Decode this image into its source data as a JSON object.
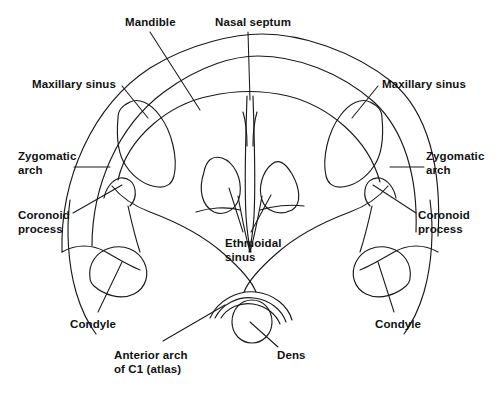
{
  "figure": {
    "type": "anatomical-line-diagram",
    "view": "axial cross-section of skull base",
    "background_color": "#ffffff",
    "line_color": "#1a1a1a",
    "text_color": "#111111",
    "width": 498,
    "height": 394
  },
  "labels": [
    {
      "id": "mandible",
      "text": "Mandible",
      "x": 125,
      "y": 16,
      "align": "left"
    },
    {
      "id": "nasal-septum",
      "text": "Nasal septum",
      "x": 215,
      "y": 16,
      "align": "left"
    },
    {
      "id": "maxillary-sinus-left",
      "text": "Maxillary sinus",
      "x": 32,
      "y": 78,
      "align": "left"
    },
    {
      "id": "maxillary-sinus-right",
      "text": "Maxillary sinus",
      "x": 382,
      "y": 78,
      "align": "left"
    },
    {
      "id": "zygomatic-arch-left",
      "text": "Zygomatic\narch",
      "x": 18,
      "y": 150,
      "align": "left"
    },
    {
      "id": "zygomatic-arch-right",
      "text": "Zygomatic\narch",
      "x": 426,
      "y": 150,
      "align": "left"
    },
    {
      "id": "coronoid-process-left",
      "text": "Coronoid\nprocess",
      "x": 18,
      "y": 209,
      "align": "left"
    },
    {
      "id": "coronoid-process-right",
      "text": "Coronoid\nprocess",
      "x": 418,
      "y": 209,
      "align": "left"
    },
    {
      "id": "ethmoidal-sinus",
      "text": "Ethmoidal\nsinus",
      "x": 225,
      "y": 237,
      "align": "left"
    },
    {
      "id": "condyle-left",
      "text": "Condyle",
      "x": 70,
      "y": 318,
      "align": "left"
    },
    {
      "id": "condyle-right",
      "text": "Condyle",
      "x": 375,
      "y": 318,
      "align": "left"
    },
    {
      "id": "anterior-arch-c1",
      "text": "Anterior arch\nof C1 (atlas)",
      "x": 114,
      "y": 349,
      "align": "left"
    },
    {
      "id": "dens",
      "text": "Dens",
      "x": 277,
      "y": 349,
      "align": "left"
    }
  ],
  "leader_lines": [
    {
      "id": "leader-mandible",
      "d": "M 150 32 L 200 110"
    },
    {
      "id": "leader-nasal-septum",
      "d": "M 248 32 L 250 100"
    },
    {
      "id": "leader-maxillary-sinus-left",
      "d": "M 122 86 L 148 118"
    },
    {
      "id": "leader-maxillary-sinus-right",
      "d": "M 378 86 L 352 118"
    },
    {
      "id": "leader-zygomatic-arch-left",
      "d": "M 74 167 L 110 167"
    },
    {
      "id": "leader-zygomatic-arch-right",
      "d": "M 424 167 L 390 167"
    },
    {
      "id": "leader-coronoid-process-left",
      "d": "M 73 213 L 122 185"
    },
    {
      "id": "leader-coronoid-process-right",
      "d": "M 416 213 L 373 185"
    },
    {
      "id": "leader-ethmoidal-sinus-left",
      "d": "M 243 232 L 229 188"
    },
    {
      "id": "leader-ethmoidal-sinus-right",
      "d": "M 251 232 L 271 195"
    },
    {
      "id": "leader-condyle-left",
      "d": "M 98 312 L 122 262"
    },
    {
      "id": "leader-condyle-right",
      "d": "M 394 312 L 378 262"
    },
    {
      "id": "leader-anterior-arch-c1",
      "d": "M 163 341 L 225 305"
    },
    {
      "id": "leader-dens",
      "d": "M 278 347 L 250 322"
    }
  ],
  "outline_paths": [
    {
      "id": "cranium-outer",
      "d": "M 62 252 C 60 180 92 106 150 68 C 192 42 238 34 262 34 C 300 34 352 50 392 82 C 428 112 442 168 438 236"
    },
    {
      "id": "cranium-inner",
      "d": "M 92 246 C 92 186 118 126 164 92 C 202 64 236 56 258 56 C 296 56 340 72 374 102 C 404 130 418 176 416 232"
    },
    {
      "id": "maxilla-arch",
      "d": "M 118 180 C 128 136 170 104 210 96 C 236 90 262 90 288 96 C 328 106 368 138 380 182"
    },
    {
      "id": "left-sinus-pocket",
      "d": "M 118 118 C 116 140 119 156 126 166 C 134 178 146 186 158 187 C 166 188 172 184 174 176 C 178 158 172 132 160 116 C 150 102 138 98 130 102 C 122 106 118 110 118 118 Z"
    },
    {
      "id": "right-sinus-pocket",
      "d": "M 382 118 C 384 140 381 156 374 166 C 366 178 354 186 342 187 C 334 188 328 184 326 176 C 322 158 328 132 340 116 C 350 102 362 98 370 102 C 378 106 382 110 382 118 Z"
    },
    {
      "id": "left-ramus-outer",
      "d": "M 112 186 C 120 196 134 206 150 212 C 174 221 204 236 224 254 C 240 268 252 282 256 292"
    },
    {
      "id": "right-ramus-outer",
      "d": "M 388 186 C 380 196 366 206 350 212 C 326 221 296 236 276 254 C 260 268 248 282 244 292"
    },
    {
      "id": "left-coronoid",
      "d": "M 104 198 C 106 188 112 180 120 178 C 128 177 134 182 135 190 C 136 196 134 202 130 206"
    },
    {
      "id": "right-coronoid",
      "d": "M 396 198 C 394 188 388 180 380 178 C 372 177 366 182 365 190 C 364 196 366 202 370 206"
    },
    {
      "id": "left-condyle",
      "d": "M 90 278 C 88 264 96 252 110 248 C 124 244 138 250 144 262 C 150 274 146 288 134 294 C 120 301 103 294 94 286 C 91 283 90 280 90 278 Z"
    },
    {
      "id": "right-condyle",
      "d": "M 410 278 C 412 264 404 252 390 248 C 376 244 362 250 356 262 C 350 274 354 288 366 294 C 380 301 397 294 406 286 C 409 283 410 280 410 278 Z"
    },
    {
      "id": "left-lateral-wall",
      "d": "M 70 200 C 66 230 68 264 76 292 C 82 312 90 326 96 334"
    },
    {
      "id": "right-lateral-wall",
      "d": "M 430 200 C 434 230 432 264 424 292 C 418 312 410 326 404 334"
    },
    {
      "id": "left-inner-ramus",
      "d": "M 128 206 C 132 224 136 240 140 252"
    },
    {
      "id": "right-inner-ramus",
      "d": "M 372 206 C 368 224 364 240 360 252"
    },
    {
      "id": "septum-line-1",
      "d": "M 247 96 C 246 130 244 180 246 216 C 247 232 249 244 251 252"
    },
    {
      "id": "septum-line-2",
      "d": "M 253 96 C 254 130 256 180 254 216 C 253 232 251 244 249 252"
    },
    {
      "id": "septum-top-left",
      "d": "M 243 112 C 246 122 247 134 247 146"
    },
    {
      "id": "septum-top-right",
      "d": "M 257 112 C 254 122 253 134 253 146"
    },
    {
      "id": "septum-apex-left",
      "d": "M 238 196 C 242 218 246 238 250 252"
    },
    {
      "id": "septum-apex-right",
      "d": "M 262 196 C 258 218 254 238 250 252"
    },
    {
      "id": "left-ethmoid-cell",
      "d": "M 204 172 C 198 190 202 206 214 212 C 226 217 238 208 240 194 C 242 178 234 162 222 158 C 212 155 206 161 204 172 Z"
    },
    {
      "id": "right-ethmoid-cell",
      "d": "M 272 164 C 262 172 258 188 262 200 C 266 212 280 216 292 210 C 302 204 300 188 292 174 C 285 162 278 159 272 164 Z"
    },
    {
      "id": "nasal-floor-left",
      "d": "M 196 212 C 208 208 226 206 240 210"
    },
    {
      "id": "nasal-floor-right",
      "d": "M 304 206 C 290 204 272 206 260 210"
    },
    {
      "id": "skullbase-left",
      "d": "M 62 252 C 76 244 92 244 106 252 C 118 259 130 266 140 270"
    },
    {
      "id": "skullbase-right",
      "d": "M 438 252 C 424 244 408 244 394 252 C 382 259 370 266 360 270"
    },
    {
      "id": "c1-arch-outer",
      "d": "M 210 318 C 218 300 238 290 256 292 C 274 294 288 306 292 320"
    },
    {
      "id": "c1-arch-mid",
      "d": "M 215 318 C 222 304 238 296 254 298 C 270 300 282 310 286 322"
    },
    {
      "id": "c1-arch-inner",
      "d": "M 221 318 C 227 308 240 302 253 304 C 266 306 276 314 280 324"
    },
    {
      "id": "dens-circle",
      "d": "M 232 322 C 232 309 241 300 252 300 C 263 300 272 309 272 322 C 272 334 263 343 252 343 C 241 343 232 334 232 322 Z"
    }
  ]
}
